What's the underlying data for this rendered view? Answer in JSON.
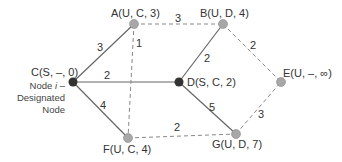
{
  "colors": {
    "solid_edge": "#666666",
    "dashed_edge": "#888888",
    "settled_node": "#333333",
    "unsettled_node": "#a8a8a8",
    "text": "#333333"
  },
  "nodes": {
    "A": {
      "label": "A(U, C, 3)",
      "state": "U"
    },
    "B": {
      "label": "B(U, D, 4)",
      "state": "U"
    },
    "C": {
      "label": "C(S, –, 0)",
      "state": "S"
    },
    "D": {
      "label": "D(S, C, 2)",
      "state": "S"
    },
    "E": {
      "label": "E(U, –, ∞)",
      "state": "U"
    },
    "F": {
      "label": "F(U, C, 4)",
      "state": "U"
    },
    "G": {
      "label": "G(U, D, 7)",
      "state": "U"
    }
  },
  "annotation": {
    "line1_prefix": "Node ",
    "line1_italic": "i",
    "line1_suffix": " –",
    "line2": "Designated",
    "line3": "Node"
  },
  "edges": {
    "CA": {
      "from": "C",
      "to": "A",
      "weight": "3",
      "style": "solid"
    },
    "CD": {
      "from": "C",
      "to": "D",
      "weight": "2",
      "style": "solid"
    },
    "CF": {
      "from": "C",
      "to": "F",
      "weight": "4",
      "style": "solid"
    },
    "DB": {
      "from": "D",
      "to": "B",
      "weight": "2",
      "style": "solid"
    },
    "DG": {
      "from": "D",
      "to": "G",
      "weight": "5",
      "style": "solid"
    },
    "AB": {
      "from": "A",
      "to": "B",
      "weight": "3",
      "style": "dashed"
    },
    "AF": {
      "from": "A",
      "to": "F",
      "weight": "1",
      "style": "dashed"
    },
    "BE": {
      "from": "B",
      "to": "E",
      "weight": "2",
      "style": "dashed"
    },
    "FG": {
      "from": "F",
      "to": "G",
      "weight": "2",
      "style": "dashed"
    },
    "GE": {
      "from": "G",
      "to": "E",
      "weight": "3",
      "style": "dashed"
    }
  }
}
